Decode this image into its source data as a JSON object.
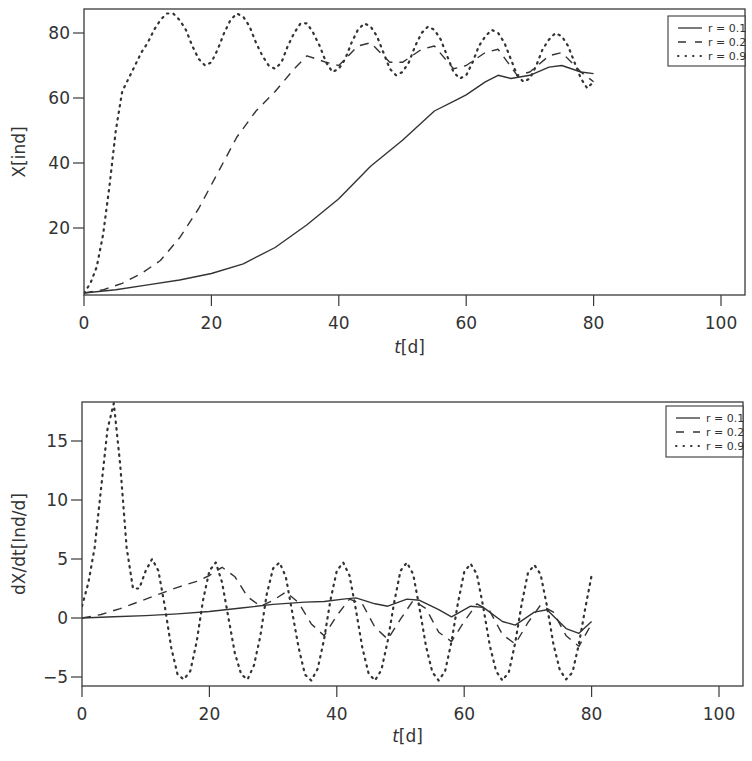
{
  "chart_data": [
    {
      "type": "line",
      "title": "",
      "xlabel": "t[d]",
      "xlabel_italic_part": "t",
      "xlabel_rest": "[d]",
      "ylabel": "X[ind]",
      "xlim": [
        0,
        104
      ],
      "ylim": [
        0,
        87
      ],
      "xticks": [
        0,
        20,
        40,
        60,
        80,
        100
      ],
      "yticks": [
        20,
        40,
        60,
        80
      ],
      "grid": false,
      "legend_position": "upper right",
      "legend": [
        "r = 0.1",
        "r = 0.2",
        "r = 0.9"
      ],
      "series": [
        {
          "name": "r = 0.1",
          "style": "solid",
          "x": [
            0,
            5,
            10,
            15,
            20,
            25,
            30,
            35,
            40,
            45,
            50,
            55,
            58,
            60,
            63,
            65,
            67,
            70,
            73,
            75,
            78,
            80
          ],
          "y": [
            0,
            1,
            2.5,
            4,
            6,
            9,
            14,
            21,
            29,
            39,
            47,
            56,
            59,
            61,
            65,
            67,
            66,
            67,
            69.5,
            70,
            68,
            67.5
          ]
        },
        {
          "name": "r = 0.2",
          "style": "dashed",
          "x": [
            0,
            3,
            6,
            9,
            12,
            15,
            18,
            21,
            24,
            27,
            30,
            33,
            35,
            38,
            40,
            43,
            45,
            48,
            50,
            53,
            55,
            58,
            60,
            63,
            65,
            68,
            70,
            73,
            75,
            78,
            80
          ],
          "y": [
            0,
            1,
            3,
            6,
            10,
            17,
            26,
            37,
            48,
            56,
            62,
            69,
            73,
            71,
            70,
            76,
            77,
            71,
            71,
            75,
            76,
            69,
            70,
            74,
            75,
            67,
            68,
            73,
            74,
            68,
            65
          ]
        },
        {
          "name": "r = 0.9",
          "style": "dotted",
          "x": [
            0,
            1,
            2,
            3,
            4,
            5,
            6,
            7,
            8,
            9,
            10,
            11,
            12,
            13,
            14,
            15,
            16,
            17,
            18,
            19,
            20,
            21,
            22,
            23,
            24,
            25,
            26,
            27,
            28,
            29,
            30,
            31,
            32,
            33,
            34,
            35,
            36,
            37,
            38,
            39,
            40,
            41,
            42,
            43,
            44,
            45,
            46,
            47,
            48,
            49,
            50,
            51,
            52,
            53,
            54,
            55,
            56,
            57,
            58,
            59,
            60,
            61,
            62,
            63,
            64,
            65,
            66,
            67,
            68,
            69,
            70,
            71,
            72,
            73,
            74,
            75,
            76,
            77,
            78,
            79,
            80
          ],
          "y": [
            0,
            3,
            8,
            18,
            33,
            50,
            62,
            66,
            70,
            74,
            77,
            81,
            84,
            86,
            86,
            84,
            81,
            76,
            72,
            70,
            71,
            75,
            80,
            84,
            86,
            85,
            82,
            77,
            73,
            70,
            69,
            71,
            76,
            80,
            83,
            83,
            80,
            76,
            71,
            68,
            69,
            72,
            77,
            81,
            83,
            82,
            79,
            74,
            69,
            67,
            68,
            71,
            76,
            80,
            82,
            81,
            78,
            73,
            68,
            66,
            67,
            71,
            76,
            79,
            81,
            80,
            77,
            72,
            67,
            65,
            66,
            70,
            75,
            78,
            80,
            79,
            76,
            71,
            66,
            63,
            65
          ]
        }
      ]
    },
    {
      "type": "line",
      "title": "",
      "xlabel": "t[d]",
      "xlabel_italic_part": "t",
      "xlabel_rest": "[d]",
      "ylabel": "dX/dt[Ind/d]",
      "xlim": [
        0,
        104
      ],
      "ylim": [
        -5.5,
        18.3
      ],
      "xticks": [
        0,
        20,
        40,
        60,
        80,
        100
      ],
      "yticks": [
        -5,
        0,
        5,
        10,
        15
      ],
      "grid": false,
      "legend_position": "upper right",
      "legend": [
        "r = 0.1",
        "r = 0.2",
        "r = 0.9"
      ],
      "series": [
        {
          "name": "r = 0.1",
          "style": "solid",
          "x": [
            0,
            5,
            10,
            15,
            20,
            25,
            30,
            35,
            38,
            41,
            43,
            46,
            48,
            51,
            53,
            56,
            58,
            61,
            63,
            66,
            68,
            71,
            73,
            76,
            78,
            80
          ],
          "y": [
            0,
            0.1,
            0.2,
            0.35,
            0.55,
            0.85,
            1.15,
            1.35,
            1.4,
            1.6,
            1.7,
            1.2,
            1.0,
            1.6,
            1.5,
            0.7,
            0.1,
            1.0,
            0.9,
            -0.3,
            -0.6,
            0.5,
            0.7,
            -0.9,
            -1.3,
            -0.3
          ]
        },
        {
          "name": "r = 0.2",
          "style": "dashed",
          "x": [
            0,
            3,
            6,
            9,
            12,
            15,
            18,
            20,
            22,
            24,
            26,
            28,
            30,
            32,
            34,
            36,
            38,
            40,
            42,
            44,
            46,
            48,
            50,
            52,
            54,
            56,
            58,
            60,
            62,
            64,
            66,
            68,
            70,
            72,
            74,
            76,
            78,
            80
          ],
          "y": [
            0,
            0.3,
            0.8,
            1.4,
            2.0,
            2.6,
            3.1,
            3.6,
            4.3,
            3.5,
            1.8,
            1.0,
            1.5,
            2.2,
            1.3,
            -0.5,
            -1.5,
            0.2,
            1.6,
            1.2,
            -0.8,
            -1.8,
            -0.1,
            1.5,
            0.8,
            -1.2,
            -2.0,
            -0.3,
            1.2,
            0.6,
            -1.4,
            -2.2,
            -0.4,
            1.1,
            0.5,
            -1.5,
            -2.4,
            -0.5
          ]
        },
        {
          "name": "r = 0.9",
          "style": "dotted",
          "x": [
            0,
            1,
            2,
            3,
            4,
            5,
            6,
            7,
            8,
            9,
            10,
            11,
            12,
            13,
            14,
            15,
            16,
            17,
            18,
            19,
            20,
            21,
            22,
            23,
            24,
            25,
            26,
            27,
            28,
            29,
            30,
            31,
            32,
            33,
            34,
            35,
            36,
            37,
            38,
            39,
            40,
            41,
            42,
            43,
            44,
            45,
            46,
            47,
            48,
            49,
            50,
            51,
            52,
            53,
            54,
            55,
            56,
            57,
            58,
            59,
            60,
            61,
            62,
            63,
            64,
            65,
            66,
            67,
            68,
            69,
            70,
            71,
            72,
            73,
            74,
            75,
            76,
            77,
            78,
            79,
            80
          ],
          "y": [
            1,
            3,
            6,
            11,
            16,
            18.2,
            13,
            6,
            2.5,
            2.5,
            4,
            5,
            4,
            1,
            -2.5,
            -4.8,
            -5.2,
            -4.5,
            -2,
            1.5,
            4,
            4.7,
            3,
            0,
            -3,
            -4.8,
            -5.2,
            -4,
            -1.5,
            2,
            4.2,
            4.7,
            3.5,
            0.5,
            -2.5,
            -4.8,
            -5.3,
            -4.3,
            -1.8,
            1.5,
            4,
            4.7,
            3.6,
            0.7,
            -2.5,
            -4.7,
            -5.3,
            -4.4,
            -1.9,
            1.3,
            4,
            4.7,
            3.7,
            0.8,
            -2.4,
            -4.6,
            -5.3,
            -4.5,
            -2,
            1.2,
            3.9,
            4.6,
            3.7,
            0.9,
            -2.3,
            -4.5,
            -5.3,
            -4.6,
            -2.1,
            1.1,
            3.8,
            4.5,
            3.7,
            1.0,
            -2.2,
            -4.4,
            -5.2,
            -4.6,
            -2.2,
            0.8,
            3.6
          ]
        }
      ]
    }
  ],
  "legend_labels": [
    "r = 0.1",
    "r = 0.2",
    "r = 0.9"
  ],
  "colors": {
    "line": "#333333",
    "frame": "#3a3a3a",
    "text": "#333333"
  }
}
